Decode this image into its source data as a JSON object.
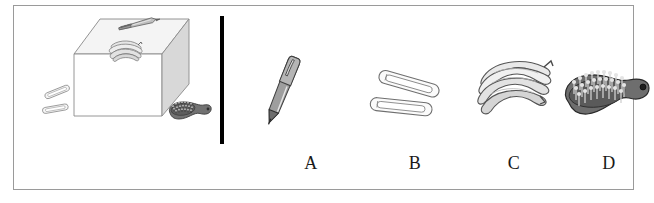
{
  "figure": {
    "type": "multiple-choice-picture-question",
    "frame_color": "#9a9a9a",
    "background_color": "#ffffff",
    "divider": {
      "name": "vertical-black-divider-bar",
      "color": "#000000"
    }
  },
  "scene": {
    "name": "reference-scene",
    "description": "Objects arranged around and on top of a rectangular box",
    "box": {
      "name": "rectangular-box",
      "top_face_color": "#f2f2f2",
      "front_face_color": "#ffffff",
      "side_face_color": "#d6d6d6",
      "outline_color": "#808080"
    },
    "objects": [
      {
        "name": "paper-clips",
        "position": "left-of-box-on-ground",
        "count": 2,
        "color": "#e8e8e8"
      },
      {
        "name": "pen",
        "position": "on-top-of-box-back",
        "color": "#9a9a9a"
      },
      {
        "name": "bananas",
        "position": "on-top-of-box-front",
        "color": "#e0e0e0"
      },
      {
        "name": "hairbrush",
        "position": "right-of-box-on-ground",
        "color": "#6e6e6e"
      }
    ]
  },
  "choices": [
    {
      "id": "A",
      "label": "A",
      "object_name": "pen",
      "body_color": "#8f8f8f",
      "highlight_color": "#d9d9d9",
      "outline_color": "#4a4a4a"
    },
    {
      "id": "B",
      "label": "B",
      "object_name": "paper-clips",
      "count": 2,
      "body_color": "#f5f5f5",
      "outline_color": "#707070"
    },
    {
      "id": "C",
      "label": "C",
      "object_name": "bananas",
      "count": 4,
      "body_color": "#ececec",
      "shade_color": "#c9c9c9",
      "outline_color": "#5a5a5a"
    },
    {
      "id": "D",
      "label": "D",
      "object_name": "hairbrush",
      "body_color": "#6b6b6b",
      "bristle_color": "#3d3d3d",
      "outline_color": "#2b2b2b"
    }
  ]
}
